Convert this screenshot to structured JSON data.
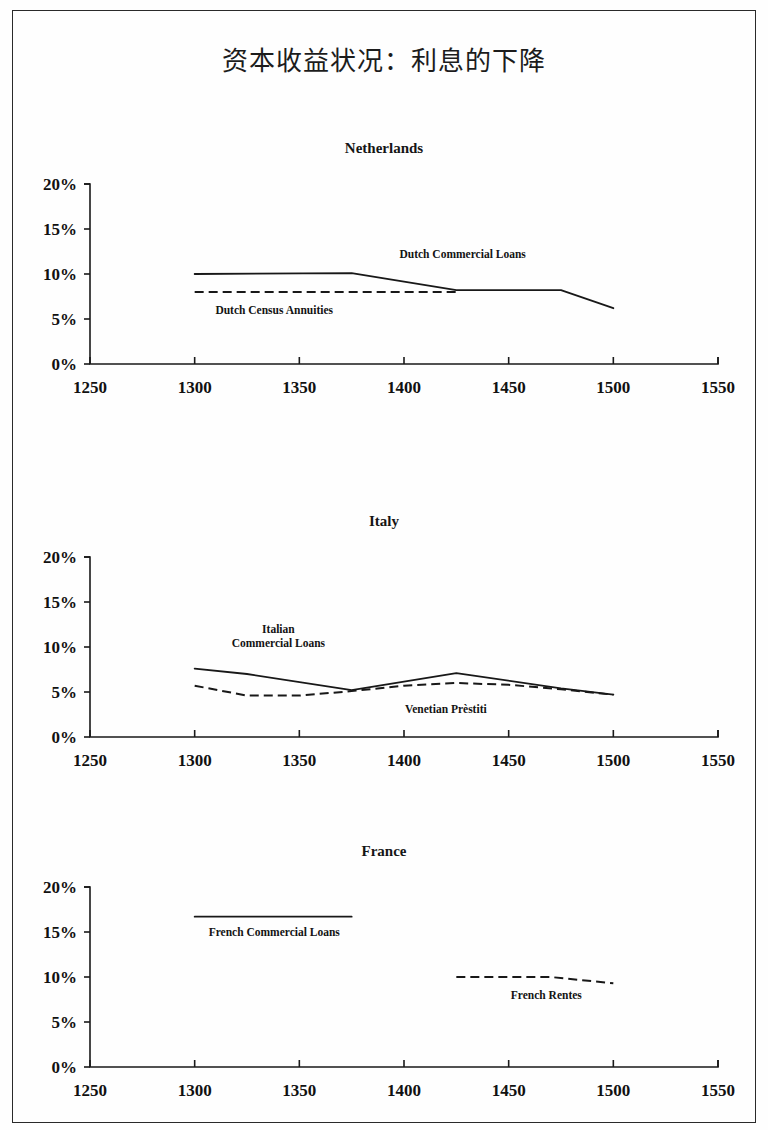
{
  "page": {
    "title": "资本收益状况：利息的下降"
  },
  "axis": {
    "y_ticks": [
      "20%",
      "15%",
      "10%",
      "5%",
      "0%"
    ],
    "y_values": [
      20,
      15,
      10,
      5,
      0
    ],
    "x_ticks": [
      "1250",
      "1300",
      "1350",
      "1400",
      "1450",
      "1500",
      "1550"
    ],
    "x_values": [
      1250,
      1300,
      1350,
      1400,
      1450,
      1500,
      1550
    ]
  },
  "panels": [
    {
      "title": "Netherlands"
    },
    {
      "title": "Italy"
    },
    {
      "title": "France"
    }
  ],
  "colors": {
    "ink": "#181818",
    "frame": "#2a2a2a",
    "page": "#fefefe"
  },
  "chart_data": [
    {
      "type": "line",
      "title": "Netherlands",
      "xlabel": "",
      "ylabel": "",
      "xlim": [
        1250,
        1550
      ],
      "ylim": [
        0,
        20
      ],
      "grid": false,
      "legend": "inline-annotations",
      "xticks": [
        1250,
        1300,
        1350,
        1400,
        1450,
        1500,
        1550
      ],
      "yticks": [
        0,
        5,
        10,
        15,
        20
      ],
      "ytick_labels": [
        "0%",
        "5%",
        "10%",
        "15%",
        "20%"
      ],
      "series": [
        {
          "name": "Dutch Commercial Loans",
          "style": "solid",
          "label_x": 1428,
          "label_y": 11.8,
          "label_anchor": "middle",
          "x": [
            1300,
            1375,
            1425,
            1475,
            1500
          ],
          "y": [
            10.0,
            10.1,
            8.2,
            8.2,
            6.2
          ]
        },
        {
          "name": "Dutch Census Annuities",
          "style": "dashed",
          "label_x": 1338,
          "label_y": 5.6,
          "label_anchor": "middle",
          "x": [
            1300,
            1425
          ],
          "y": [
            8.0,
            8.0
          ]
        }
      ]
    },
    {
      "type": "line",
      "title": "Italy",
      "xlabel": "",
      "ylabel": "",
      "xlim": [
        1250,
        1550
      ],
      "ylim": [
        0,
        20
      ],
      "grid": false,
      "legend": "inline-annotations",
      "xticks": [
        1250,
        1300,
        1350,
        1400,
        1450,
        1500,
        1550
      ],
      "yticks": [
        0,
        5,
        10,
        15,
        20
      ],
      "ytick_labels": [
        "0%",
        "5%",
        "10%",
        "15%",
        "20%"
      ],
      "series": [
        {
          "name": "Italian Commercial Loans",
          "style": "solid",
          "label_lines": [
            "Italian",
            "Commercial Loans"
          ],
          "label_x": 1340,
          "label_y": 11.6,
          "label_anchor": "middle",
          "x": [
            1300,
            1325,
            1375,
            1425,
            1475,
            1500
          ],
          "y": [
            7.6,
            7.0,
            5.2,
            7.1,
            5.4,
            4.7
          ]
        },
        {
          "name": "Venetian Prèstiti",
          "style": "dashed",
          "label_x": 1420,
          "label_y": 2.7,
          "label_anchor": "middle",
          "x": [
            1300,
            1325,
            1350,
            1375,
            1400,
            1425,
            1450,
            1475,
            1500
          ],
          "y": [
            5.7,
            4.6,
            4.6,
            5.1,
            5.7,
            6.0,
            5.8,
            5.3,
            4.7
          ]
        }
      ]
    },
    {
      "type": "line",
      "title": "France",
      "xlabel": "",
      "ylabel": "",
      "xlim": [
        1250,
        1550
      ],
      "ylim": [
        0,
        20
      ],
      "grid": false,
      "legend": "inline-annotations",
      "xticks": [
        1250,
        1300,
        1350,
        1400,
        1450,
        1500,
        1550
      ],
      "yticks": [
        0,
        5,
        10,
        15,
        20
      ],
      "ytick_labels": [
        "0%",
        "5%",
        "10%",
        "15%",
        "20%"
      ],
      "series": [
        {
          "name": "French Commercial Loans",
          "style": "solid",
          "label_x": 1338,
          "label_y": 14.6,
          "label_anchor": "middle",
          "x": [
            1300,
            1375
          ],
          "y": [
            16.7,
            16.7
          ]
        },
        {
          "name": "French Rentes",
          "style": "dashed",
          "label_x": 1468,
          "label_y": 7.6,
          "label_anchor": "middle",
          "x": [
            1425,
            1470,
            1500
          ],
          "y": [
            10.0,
            10.0,
            9.3
          ]
        }
      ]
    }
  ]
}
